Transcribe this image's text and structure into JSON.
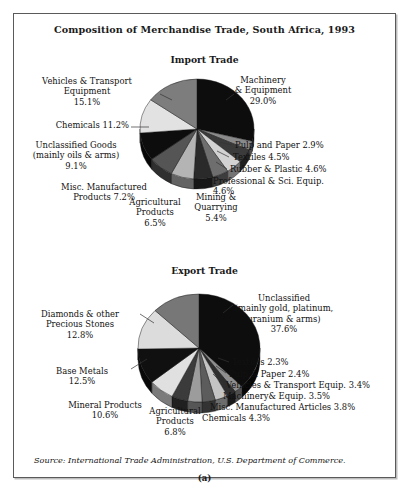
{
  "figure": {
    "title": "Composition of Merchandise Trade, South Africa, 1993",
    "source": "Source: International Trade Administration, U.S. Department of Commerce.",
    "panel_letter": "(a)"
  },
  "import_panel": {
    "title": "Import Trade",
    "labels": {
      "machinery": "Machinery\n& Equipment\n29.0%",
      "vehicles": "Vehicles & Transport\nEquipment\n15.1%",
      "chemicals": "Chemicals 11.2%",
      "unclassified": "Unclassified Goods\n(mainly oils & arms)\n9.1%",
      "misc": "Misc. Manufactured\nProducts 7.2%",
      "agricultural": "Agricultural\nProducts\n6.5%",
      "mining": "Mining &\nQuarrying\n5.4%",
      "professional": "Professional & Sci. Equip.\n4.6%",
      "rubber": "Rubber & Plastic 4.6%",
      "textiles": "Textiles 4.5%",
      "pulp": "Pulp and Paper 2.9%"
    }
  },
  "export_panel": {
    "title": "Export Trade",
    "labels": {
      "unclassified": "Unclassified\n(mainly gold, platinum,\nuranium & arms)\n37.6%",
      "diamonds": "Diamonds & other\nPrecious Stones\n12.8%",
      "base_metals": "Base Metals\n12.5%",
      "mineral": "Mineral Products\n10.6%",
      "agricultural": "Agricultural\nProducts\n6.8%",
      "chemicals": "Chemicals 4.3%",
      "misc": "Misc. Manufactured Articles 3.8%",
      "machinery": "Machinery& Equip. 3.5%",
      "vehicles": "Vehicles & Transport Equip. 3.4%",
      "pulp": "Pulp & Paper 2.4%",
      "textiles": "Textiles 2.3%"
    }
  },
  "chart_data": [
    {
      "type": "pie",
      "title": "Import Trade",
      "figure_title": "Composition of Merchandise Trade, South Africa, 1993",
      "unit": "percent",
      "total": 100.1,
      "start_angle_deg": -90,
      "direction": "clockwise",
      "legend": "labels-outside-with-leader-lines",
      "categories": [
        "Machinery & Equipment",
        "Pulp and Paper",
        "Textiles",
        "Rubber & Plastic",
        "Professional & Sci. Equip.",
        "Mining & Quarrying",
        "Agricultural Products",
        "Misc. Manufactured Products",
        "Unclassified Goods (mainly oils & arms)",
        "Chemicals",
        "Vehicles & Transport Equipment"
      ],
      "values": [
        29.0,
        2.9,
        4.5,
        4.6,
        4.6,
        5.4,
        6.5,
        7.2,
        9.1,
        11.2,
        15.1
      ],
      "colors": [
        "#0d0d0d",
        "#8a8a8a",
        "#3b3b3b",
        "#d2d2d2",
        "#6e6e6e",
        "#2a2a2a",
        "#b4b4b4",
        "#555555",
        "#0d0d0d",
        "#e2e2e2",
        "#7d7d7d"
      ]
    },
    {
      "type": "pie",
      "title": "Export Trade",
      "figure_title": "Composition of Merchandise Trade, South Africa, 1993",
      "unit": "percent",
      "total": 100.0,
      "start_angle_deg": -90,
      "direction": "clockwise",
      "legend": "labels-outside-with-leader-lines",
      "categories": [
        "Unclassified (mainly gold, platinum, uranium & arms)",
        "Textiles",
        "Pulp & Paper",
        "Vehicles & Transport Equip.",
        "Machinery & Equip.",
        "Misc. Manufactured Articles",
        "Chemicals",
        "Agricultural Products",
        "Mineral Products",
        "Base Metals",
        "Diamonds & other Precious Stones"
      ],
      "values": [
        37.6,
        2.3,
        2.4,
        3.4,
        3.5,
        3.8,
        4.3,
        6.8,
        10.6,
        12.5,
        12.8
      ],
      "colors": [
        "#0d0d0d",
        "#8f8f8f",
        "#2e2e2e",
        "#c4c4c4",
        "#5c5c5c",
        "#9c9c9c",
        "#3b3b3b",
        "#e0e0e0",
        "#101010",
        "#dcdcdc",
        "#777777"
      ]
    }
  ]
}
